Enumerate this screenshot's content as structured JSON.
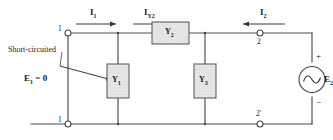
{
  "diagram": {
    "type": "circuit-schematic",
    "colors": {
      "wire": "#4a4a4a",
      "component_fill": "#e2e2e2",
      "component_stroke": "#5a5a5a",
      "text": "#1a1a1a"
    },
    "annotations": {
      "short_circuit_note": "Short-circuited",
      "input_voltage": "E",
      "input_voltage_sub": "1",
      "input_voltage_value": "= 0"
    },
    "currents": [
      {
        "name": "I1",
        "label": "I",
        "sub": "1",
        "direction": "right"
      },
      {
        "name": "IY2",
        "label": "I",
        "sub": "Y2",
        "direction": "right"
      },
      {
        "name": "I2",
        "label": "I",
        "sub": "2",
        "direction": "left"
      }
    ],
    "components": [
      {
        "name": "Y1",
        "label": "Y",
        "sub": "1",
        "orientation": "vertical"
      },
      {
        "name": "Y2",
        "label": "Y",
        "sub": "2",
        "orientation": "horizontal"
      },
      {
        "name": "Y3",
        "label": "Y",
        "sub": "3",
        "orientation": "vertical"
      }
    ],
    "source": {
      "name": "E2",
      "label": "E",
      "sub": "2",
      "type": "ac",
      "plus": "+",
      "minus": "−"
    },
    "terminals": [
      {
        "name": "terminal-1",
        "label": "1",
        "position": "top-left"
      },
      {
        "name": "terminal-1p",
        "label": "1",
        "position": "bottom-left"
      },
      {
        "name": "terminal-2",
        "label": "2",
        "position": "top-right"
      },
      {
        "name": "terminal-2p",
        "label": "2'",
        "position": "bottom-right"
      }
    ]
  }
}
